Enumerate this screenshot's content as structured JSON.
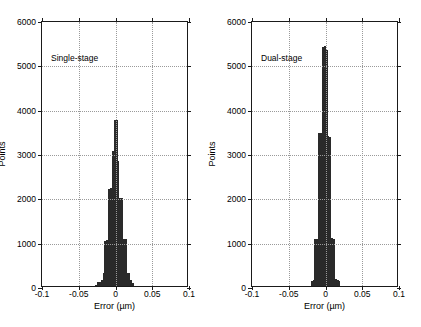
{
  "figure": {
    "width": 421,
    "height": 327,
    "background": "#ffffff",
    "axis_color": "#1a1a1a",
    "grid_color": "#9a9a9a",
    "bar_edge_color": "#2a2a2a",
    "bar_fill_color": "#ffffff"
  },
  "axis": {
    "xlabel": "Error (µm)",
    "ylabel": "Points",
    "xlim": [
      -0.1,
      0.1
    ],
    "ylim": [
      0,
      6000
    ],
    "xticks": [
      -0.1,
      -0.05,
      0,
      0.05,
      0.1
    ],
    "xticklabels": [
      "-0.1",
      "-0.05",
      "0",
      "0.05",
      "0.1"
    ],
    "yticks": [
      0,
      1000,
      2000,
      3000,
      4000,
      5000,
      6000
    ],
    "yticklabels": [
      "0",
      "1000",
      "2000",
      "3000",
      "4000",
      "5000",
      "6000"
    ],
    "grid": true,
    "grid_style": "dotted"
  },
  "chart_data": [
    {
      "type": "bar",
      "panel": "left",
      "title": "Single-stage",
      "annotation": "Single-stage",
      "xlabel": "Error (µm)",
      "ylabel": "Points",
      "xlim": [
        -0.1,
        0.1
      ],
      "ylim": [
        0,
        6000
      ],
      "xticks": [
        -0.1,
        -0.05,
        0,
        0.05,
        0.1
      ],
      "yticks": [
        0,
        1000,
        2000,
        3000,
        4000,
        5000,
        6000
      ],
      "grid": true,
      "legend": "none",
      "bin_width": 0.0025,
      "bin_centers": [
        -0.02625,
        -0.02375,
        -0.02125,
        -0.01875,
        -0.01625,
        -0.01375,
        -0.01125,
        -0.00875,
        -0.00625,
        -0.00375,
        -0.00125,
        0.00125,
        0.00375,
        0.00625,
        0.00875,
        0.01125,
        0.01375,
        0.01625,
        0.01875,
        0.02125,
        0.02375
      ],
      "values": [
        30,
        80,
        95,
        140,
        300,
        1020,
        1040,
        2190,
        2200,
        3040,
        3740,
        3740,
        2810,
        1980,
        1980,
        1060,
        1070,
        300,
        300,
        140,
        60
      ],
      "peak_value": 3740,
      "peak_location": 0.0
    },
    {
      "type": "bar",
      "panel": "right",
      "title": "Dual-stage",
      "annotation": "Dual-stage",
      "xlabel": "Error (µm)",
      "ylabel": "Points",
      "xlim": [
        -0.1,
        0.1
      ],
      "ylim": [
        0,
        6000
      ],
      "xticks": [
        -0.1,
        -0.05,
        0,
        0.05,
        0.1
      ],
      "yticks": [
        0,
        1000,
        2000,
        3000,
        4000,
        5000,
        6000
      ],
      "grid": true,
      "legend": "none",
      "bin_width": 0.0025,
      "bin_centers": [
        -0.01875,
        -0.01625,
        -0.01375,
        -0.01125,
        -0.00875,
        -0.00625,
        -0.00375,
        -0.00125,
        0.00125,
        0.00375,
        0.00625,
        0.00875,
        0.01125,
        0.01375,
        0.01625,
        0.01875
      ],
      "values": [
        120,
        130,
        1050,
        1060,
        3450,
        3460,
        5400,
        5410,
        5320,
        3380,
        3370,
        1080,
        1070,
        150,
        140,
        120
      ],
      "peak_value": 5410,
      "peak_location": 0.0
    }
  ]
}
